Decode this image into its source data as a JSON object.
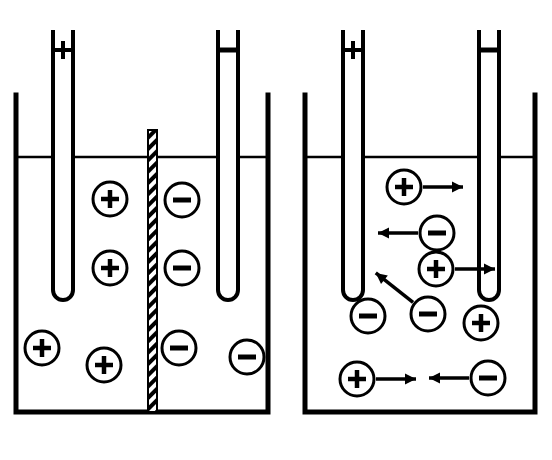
{
  "figure": {
    "background_color": "#ffffff",
    "stroke_color": "#000000"
  },
  "panels": [
    {
      "id": "a",
      "caption": "[a]",
      "caption_x": 139,
      "caption_y": 438,
      "container": {
        "left": 16,
        "right": 268,
        "top": 95,
        "bottom": 412,
        "liquid_line_y": 157
      },
      "electrodes": [
        {
          "name": "anode",
          "label": "Anode",
          "label_x": 63,
          "label_y": 16,
          "sign": "+",
          "sign_y": 50,
          "rod_left": 53,
          "rod_right": 73,
          "rod_top": 30,
          "rod_bottom": 300
        },
        {
          "name": "cathode",
          "label": "Cathode",
          "label_x": 228,
          "label_y": 16,
          "sign": "−",
          "sign_y": 50,
          "rod_left": 218,
          "rod_right": 238,
          "rod_top": 30,
          "rod_bottom": 300
        }
      ],
      "barrier": {
        "label": "barrier to ions",
        "label_x": 155,
        "label_y": 122,
        "x_left": 148,
        "x_right": 157,
        "y_top": 130,
        "y_bottom": 412
      },
      "ions": [
        {
          "charge": "+",
          "cx": 110,
          "cy": 199,
          "r": 17,
          "arrow": null
        },
        {
          "charge": "+",
          "cx": 110,
          "cy": 268,
          "r": 17,
          "arrow": null
        },
        {
          "charge": "+",
          "cx": 42,
          "cy": 348,
          "r": 17,
          "arrow": null
        },
        {
          "charge": "+",
          "cx": 104,
          "cy": 365,
          "r": 17,
          "arrow": null
        },
        {
          "charge": "−",
          "cx": 182,
          "cy": 200,
          "r": 17,
          "arrow": null
        },
        {
          "charge": "−",
          "cx": 182,
          "cy": 268,
          "r": 17,
          "arrow": null
        },
        {
          "charge": "−",
          "cx": 179,
          "cy": 348,
          "r": 17,
          "arrow": null
        },
        {
          "charge": "−",
          "cx": 247,
          "cy": 357,
          "r": 17,
          "arrow": null
        }
      ]
    },
    {
      "id": "b",
      "caption": "[b]",
      "caption_x": 415,
      "caption_y": 438,
      "container": {
        "left": 305,
        "right": 535,
        "top": 95,
        "bottom": 412,
        "liquid_line_y": 157
      },
      "electrodes": [
        {
          "name": "anode",
          "label": "Anode",
          "label_x": 353,
          "label_y": 16,
          "sign": "+",
          "sign_y": 50,
          "rod_left": 343,
          "rod_right": 363,
          "rod_top": 30,
          "rod_bottom": 300
        },
        {
          "name": "cathode",
          "label": "Cathode",
          "label_x": 489,
          "label_y": 16,
          "sign": "−",
          "sign_y": 50,
          "rod_left": 479,
          "rod_right": 499,
          "rod_top": 30,
          "rod_bottom": 300
        }
      ],
      "barrier": null,
      "ions": [
        {
          "charge": "+",
          "cx": 404,
          "cy": 187,
          "r": 17,
          "arrow": {
            "dx": 46,
            "dy": 0
          }
        },
        {
          "charge": "−",
          "cx": 437,
          "cy": 233,
          "r": 17,
          "arrow": {
            "dx": -46,
            "dy": 0
          }
        },
        {
          "charge": "+",
          "cx": 436,
          "cy": 269,
          "r": 17,
          "arrow": {
            "dx": 46,
            "dy": 0
          }
        },
        {
          "charge": "−",
          "cx": 368,
          "cy": 316,
          "r": 17,
          "arrow": null
        },
        {
          "charge": "−",
          "cx": 428,
          "cy": 314,
          "r": 17,
          "arrow": {
            "dx": -42,
            "dy": -33
          }
        },
        {
          "charge": "+",
          "cx": 481,
          "cy": 323,
          "r": 17,
          "arrow": null
        },
        {
          "charge": "+",
          "cx": 357,
          "cy": 379,
          "r": 17,
          "arrow": {
            "dx": 46,
            "dy": 0
          }
        },
        {
          "charge": "−",
          "cx": 488,
          "cy": 378,
          "r": 17,
          "arrow": {
            "dx": -46,
            "dy": 0
          }
        }
      ]
    }
  ]
}
